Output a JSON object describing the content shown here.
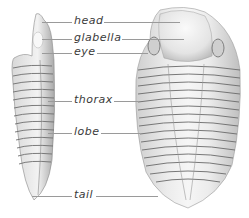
{
  "diagram": {
    "views": [
      "side view",
      "top view"
    ],
    "labels": [
      {
        "id": "head",
        "text": "head",
        "y": 21,
        "x": 73
      },
      {
        "id": "glabella",
        "text": "glabella",
        "y": 38,
        "x": 73
      },
      {
        "id": "eye",
        "text": "eye",
        "y": 52,
        "x": 73
      },
      {
        "id": "thorax",
        "text": "thorax",
        "y": 100,
        "x": 73
      },
      {
        "id": "lobe",
        "text": "lobe",
        "y": 132,
        "x": 73
      },
      {
        "id": "tail",
        "text": "tail",
        "y": 195,
        "x": 73
      }
    ],
    "colors": {
      "background": "#ffffff",
      "ink": "#3a3a3a",
      "leader": "#9a9a9a",
      "shell_light": "#e8e8e8",
      "shell_dark": "#6e6e6e"
    }
  }
}
